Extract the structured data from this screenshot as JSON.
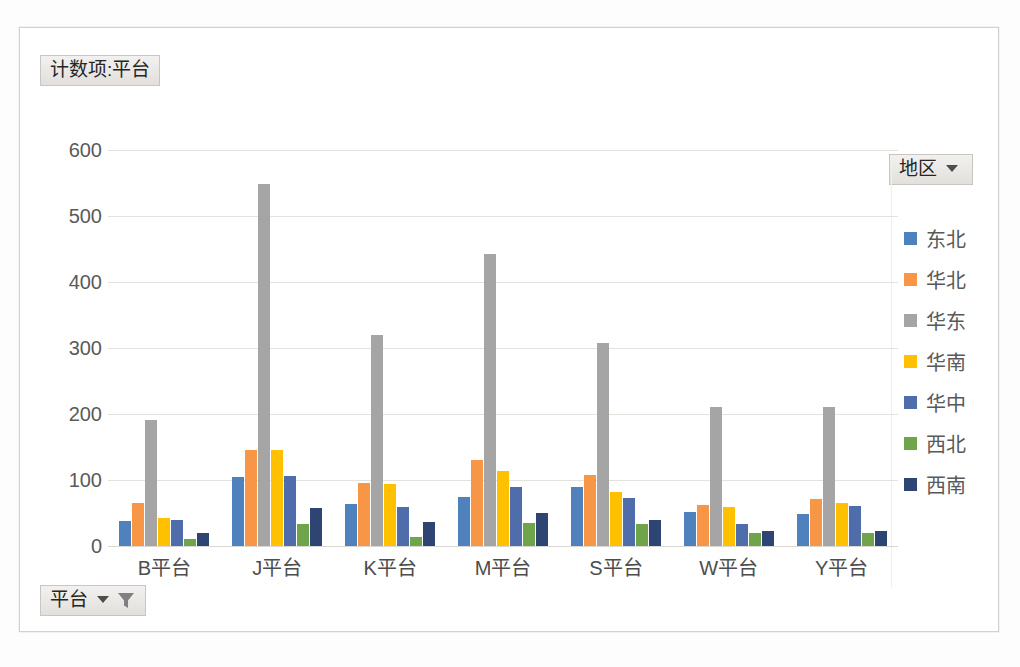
{
  "window": {
    "value_field_label": "计数项:平台",
    "axis_field_label": "平台",
    "legend_field_label": "地区",
    "caret_icon": "chevron-down-icon",
    "filter_icon": "funnel-filter-icon"
  },
  "chart_data": {
    "type": "bar",
    "title": "计数项:平台",
    "xlabel": "平台",
    "ylabel": "",
    "ylim": [
      0,
      600
    ],
    "yticks": [
      0,
      100,
      200,
      300,
      400,
      500,
      600
    ],
    "grid": true,
    "legend_position": "right",
    "legend_title": "地区",
    "categories": [
      "B平台",
      "J平台",
      "K平台",
      "M平台",
      "S平台",
      "W平台",
      "Y平台"
    ],
    "series": [
      {
        "name": "东北",
        "color": "#4f81bd",
        "values": [
          38,
          105,
          63,
          75,
          90,
          51,
          48
        ]
      },
      {
        "name": "华北",
        "color": "#f79646",
        "values": [
          65,
          146,
          96,
          131,
          108,
          62,
          71
        ]
      },
      {
        "name": "华东",
        "color": "#a5a5a5",
        "values": [
          191,
          548,
          320,
          443,
          307,
          211,
          210
        ]
      },
      {
        "name": "华南",
        "color": "#ffc000",
        "values": [
          43,
          145,
          94,
          114,
          82,
          59,
          65
        ]
      },
      {
        "name": "华中",
        "color": "#4f6daa",
        "values": [
          40,
          106,
          59,
          90,
          73,
          33,
          61
        ]
      },
      {
        "name": "西北",
        "color": "#6fa44a",
        "values": [
          11,
          33,
          14,
          35,
          34,
          20,
          20
        ]
      },
      {
        "name": "西南",
        "color": "#2e4472",
        "values": [
          20,
          57,
          36,
          50,
          40,
          22,
          22
        ]
      }
    ]
  }
}
